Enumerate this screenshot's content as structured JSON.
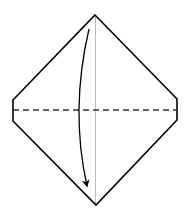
{
  "diagram": {
    "type": "origami-fold-step",
    "colors": {
      "outline": "#000000",
      "crease": "#bbbbbb",
      "fold_line": "#333333",
      "arrow": "#000000",
      "background": "#ffffff"
    },
    "shape": {
      "top": [
        95,
        15
      ],
      "upper_right": [
        177,
        99
      ],
      "lower_right": [
        177,
        120
      ],
      "bottom": [
        96,
        205
      ],
      "lower_left": [
        13,
        121
      ],
      "upper_left": [
        13,
        100
      ]
    },
    "vertical_crease": {
      "x": 95.5,
      "y1": 15,
      "y2": 205
    },
    "fold_line": {
      "y": 110,
      "x1": 13,
      "x2": 177,
      "style": "dashed"
    },
    "arrow": {
      "start": [
        89,
        29
      ],
      "control": [
        70,
        110
      ],
      "end": [
        87,
        186
      ]
    }
  }
}
